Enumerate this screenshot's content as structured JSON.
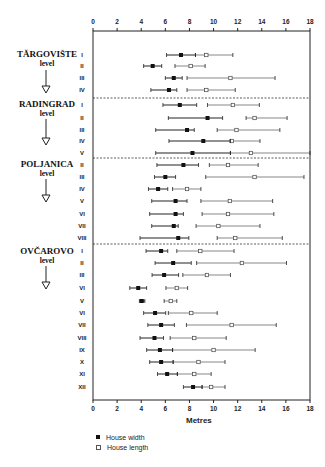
{
  "chart_data": {
    "type": "range",
    "title": "",
    "xlabel": "Metres",
    "ylabel": "",
    "xlim": [
      0,
      18
    ],
    "x_ticks": [
      0,
      2,
      4,
      6,
      8,
      10,
      12,
      14,
      16,
      18
    ],
    "grid": false,
    "legend": [
      {
        "name": "House width",
        "marker": "filled-square"
      },
      {
        "name": "House length",
        "marker": "open-square"
      }
    ],
    "legend_position": "bottom-left",
    "groups": [
      {
        "name": "TĂRGOVIŠTE",
        "sub": "level",
        "rows": [
          {
            "label": "I",
            "width": [
              6.1,
              7.3,
              8.5
            ],
            "length": [
              8.5,
              9.4,
              11.6
            ]
          },
          {
            "label": "II",
            "width": [
              4.2,
              4.95,
              5.7
            ],
            "length": [
              6.8,
              8.1,
              9.3
            ]
          },
          {
            "label": "III",
            "width": [
              6.0,
              6.7,
              7.4
            ],
            "length": [
              7.8,
              11.4,
              15.1
            ]
          },
          {
            "label": "IV",
            "width": [
              4.8,
              6.3,
              6.95
            ],
            "length": [
              7.8,
              9.4,
              11.8
            ]
          }
        ]
      },
      {
        "name": "RADINGRAD",
        "sub": "level",
        "rows": [
          {
            "label": "I",
            "width": [
              5.8,
              7.2,
              8.6
            ],
            "length": [
              9.5,
              11.6,
              13.8
            ]
          },
          {
            "label": "II",
            "width": [
              6.25,
              9.5,
              10.75
            ],
            "length": [
              12.7,
              13.4,
              16.1
            ]
          },
          {
            "label": "III",
            "width": [
              5.2,
              7.8,
              8.4
            ],
            "length": [
              10.3,
              11.9,
              15.5
            ]
          },
          {
            "label": "IV",
            "width": [
              6.3,
              9.15,
              11.4
            ],
            "length": [
              11.4,
              11.5,
              13.85
            ]
          },
          {
            "label": "V",
            "width": [
              5.2,
              8.25,
              11.4
            ],
            "length": [
              11.4,
              13.1,
              18.0
            ]
          }
        ]
      },
      {
        "name": "POLJANICA",
        "sub": "level",
        "rows": [
          {
            "label": "II",
            "width": [
              5.3,
              7.5,
              8.75
            ],
            "length": [
              9.65,
              11.2,
              13.7
            ]
          },
          {
            "label": "III",
            "width": [
              5.1,
              6.0,
              6.85
            ],
            "length": [
              9.35,
              13.4,
              17.5
            ]
          },
          {
            "label": "IV",
            "width": [
              4.6,
              5.4,
              6.2
            ],
            "length": [
              6.6,
              7.8,
              8.95
            ]
          },
          {
            "label": "V",
            "width": [
              4.87,
              6.85,
              7.8
            ],
            "length": [
              8.95,
              11.35,
              14.9
            ]
          },
          {
            "label": "VI",
            "width": [
              4.7,
              6.85,
              7.5
            ],
            "length": [
              9.05,
              11.2,
              15.0
            ]
          },
          {
            "label": "VII",
            "width": [
              4.87,
              6.7,
              7.07
            ],
            "length": [
              8.55,
              10.4,
              13.85
            ]
          },
          {
            "label": "VIII",
            "width": [
              3.9,
              7.07,
              7.95
            ],
            "length": [
              10.3,
              11.8,
              15.7
            ]
          }
        ]
      },
      {
        "name": "OVČAROVO",
        "sub": "level",
        "rows": [
          {
            "label": "I",
            "width": [
              4.4,
              5.65,
              6.2
            ],
            "length": [
              6.95,
              8.9,
              11.7
            ]
          },
          {
            "label": "II",
            "width": [
              5.15,
              6.65,
              8.15
            ],
            "length": [
              8.6,
              12.35,
              16.05
            ]
          },
          {
            "label": "III",
            "width": [
              4.9,
              5.9,
              7.1
            ],
            "length": [
              7.45,
              9.45,
              11.4
            ]
          },
          {
            "label": "VI",
            "width": [
              3.05,
              3.75,
              4.45
            ],
            "length": [
              6.05,
              6.95,
              7.85
            ]
          },
          {
            "label": "V",
            "width": [
              3.85,
              4.05,
              4.3
            ],
            "length": [
              5.9,
              6.45,
              6.95
            ]
          },
          {
            "label": "VI",
            "width": [
              4.2,
              5.15,
              6.03
            ],
            "length": [
              6.25,
              8.15,
              10.3
            ]
          },
          {
            "label": "VII",
            "width": [
              4.55,
              5.65,
              6.75
            ],
            "length": [
              7.75,
              11.5,
              15.2
            ]
          },
          {
            "label": "VIII",
            "width": [
              3.9,
              5.1,
              5.85
            ],
            "length": [
              6.4,
              8.4,
              11.05
            ]
          },
          {
            "label": "IX",
            "width": [
              4.45,
              5.55,
              6.6
            ],
            "length": [
              6.6,
              10.0,
              13.45
            ]
          },
          {
            "label": "X",
            "width": [
              4.7,
              5.65,
              6.65
            ],
            "length": [
              6.65,
              8.75,
              10.95
            ]
          },
          {
            "label": "XI",
            "width": [
              5.35,
              6.15,
              7.0
            ],
            "length": [
              7.0,
              8.4,
              9.8
            ]
          },
          {
            "label": "XII",
            "width": [
              7.5,
              8.3,
              9.05
            ],
            "length": [
              9.05,
              9.8,
              10.95
            ]
          }
        ]
      }
    ]
  },
  "labels": {
    "levels": [
      {
        "name": "TĂRGOVIŠTE",
        "sub": "level"
      },
      {
        "name": "RADINGRAD",
        "sub": "level"
      },
      {
        "name": "POLJANICA",
        "sub": "level"
      },
      {
        "name": "OVČAROVO",
        "sub": "level"
      }
    ],
    "axis_title": "Metres",
    "legend_width": "House width",
    "legend_length": "House length"
  },
  "colors": {
    "width_marker": "#111111",
    "length_marker": "#ffffff",
    "line": "#333333",
    "frame": "#222222"
  }
}
